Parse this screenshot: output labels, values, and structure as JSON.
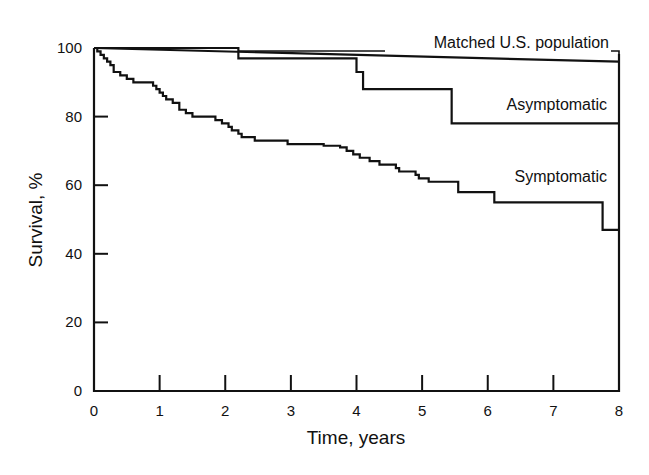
{
  "chart_data": {
    "type": "line",
    "subtype": "kaplan-meier step survival curves",
    "title": "",
    "xlabel": "Time, years",
    "ylabel": "Survival, %",
    "xlim": [
      0,
      8
    ],
    "ylim": [
      0,
      100
    ],
    "x_ticks": [
      0,
      1,
      2,
      3,
      4,
      5,
      6,
      7,
      8
    ],
    "y_ticks": [
      0,
      20,
      40,
      60,
      80,
      100
    ],
    "grid": false,
    "legend": "inline labels",
    "series": [
      {
        "name": "Matched U.S. population",
        "step": false,
        "points": [
          [
            0,
            100
          ],
          [
            8,
            96
          ]
        ]
      },
      {
        "name": "Asymptomatic",
        "step": true,
        "points": [
          [
            0,
            100
          ],
          [
            2.2,
            100
          ],
          [
            2.2,
            97
          ],
          [
            4.0,
            97
          ],
          [
            4.0,
            93
          ],
          [
            4.1,
            93
          ],
          [
            4.1,
            88
          ],
          [
            5.45,
            88
          ],
          [
            5.45,
            78
          ],
          [
            8,
            78
          ]
        ]
      },
      {
        "name": "Symptomatic",
        "step": true,
        "points": [
          [
            0,
            100
          ],
          [
            0.05,
            99
          ],
          [
            0.1,
            98
          ],
          [
            0.15,
            97
          ],
          [
            0.2,
            96
          ],
          [
            0.25,
            95
          ],
          [
            0.3,
            93
          ],
          [
            0.4,
            92
          ],
          [
            0.5,
            91
          ],
          [
            0.6,
            90
          ],
          [
            0.85,
            90
          ],
          [
            0.9,
            89
          ],
          [
            0.95,
            88
          ],
          [
            1.0,
            87
          ],
          [
            1.05,
            86
          ],
          [
            1.1,
            85
          ],
          [
            1.2,
            84
          ],
          [
            1.3,
            82
          ],
          [
            1.4,
            81
          ],
          [
            1.5,
            80
          ],
          [
            1.75,
            80
          ],
          [
            1.85,
            79
          ],
          [
            1.95,
            78
          ],
          [
            2.05,
            77
          ],
          [
            2.1,
            76
          ],
          [
            2.2,
            75
          ],
          [
            2.25,
            74
          ],
          [
            2.4,
            74
          ],
          [
            2.45,
            73
          ],
          [
            2.8,
            73
          ],
          [
            2.95,
            72
          ],
          [
            3.4,
            72
          ],
          [
            3.5,
            71.5
          ],
          [
            3.75,
            71
          ],
          [
            3.85,
            70
          ],
          [
            3.95,
            69
          ],
          [
            4.05,
            68
          ],
          [
            4.2,
            67
          ],
          [
            4.35,
            66
          ],
          [
            4.6,
            65
          ],
          [
            4.65,
            64
          ],
          [
            4.9,
            63
          ],
          [
            4.95,
            62
          ],
          [
            5.1,
            61
          ],
          [
            5.55,
            61
          ],
          [
            5.55,
            58
          ],
          [
            6.1,
            58
          ],
          [
            6.1,
            55
          ],
          [
            7.75,
            55
          ],
          [
            7.75,
            47
          ],
          [
            8,
            47
          ]
        ]
      }
    ],
    "annotations": [
      "Matched U.S. population",
      "Asymptomatic",
      "Symptomatic"
    ]
  },
  "axes": {
    "xlabel": "Time, years",
    "ylabel": "Survival, %",
    "x_tick_labels": [
      "0",
      "1",
      "2",
      "3",
      "4",
      "5",
      "6",
      "7",
      "8"
    ],
    "y_tick_labels": [
      "0",
      "20",
      "40",
      "60",
      "80",
      "100"
    ]
  },
  "labels": {
    "matched": "Matched U.S. population",
    "asymptomatic": "Asymptomatic",
    "symptomatic": "Symptomatic"
  },
  "colors": {
    "line": "#111111",
    "background": "#ffffff"
  }
}
